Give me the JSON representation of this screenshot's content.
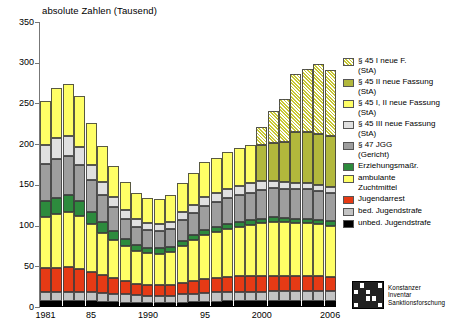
{
  "chart_data": {
    "type": "bar",
    "stacked": true,
    "title": "absolute Zahlen (Tausend)",
    "xlabel": "",
    "ylabel": "absolute Zahlen (Tausend)",
    "ylim": [
      0,
      350
    ],
    "ytick_labels": [
      "0",
      "50",
      "100",
      "150",
      "200",
      "250",
      "300",
      "350"
    ],
    "ytick_values": [
      0,
      50,
      100,
      150,
      200,
      250,
      300,
      350
    ],
    "grid": false,
    "legend_position": "right",
    "categories": [
      1981,
      1982,
      1983,
      1984,
      1985,
      1986,
      1987,
      1988,
      1989,
      1990,
      1991,
      1992,
      1993,
      1994,
      1995,
      1996,
      1997,
      1998,
      1999,
      2000,
      2001,
      2002,
      2003,
      2004,
      2005,
      2006
    ],
    "xtick_labels": [
      "1981",
      "85",
      "1990",
      "95",
      "2000",
      "2006"
    ],
    "xtick_categories": [
      1981,
      1985,
      1990,
      1995,
      2000,
      2006
    ],
    "series": [
      {
        "name": "unbed. Jugendstrafe",
        "color": "#000000",
        "hatch": false,
        "values": [
          7.0,
          7.0,
          7.0,
          7.0,
          7.0,
          6.5,
          6.0,
          5.5,
          5.0,
          5.0,
          5.0,
          5.0,
          5.5,
          6.0,
          6.5,
          6.5,
          7.0,
          7.0,
          7.0,
          7.0,
          7.0,
          7.0,
          7.0,
          7.0,
          7.0,
          7.0
        ]
      },
      {
        "name": "bed. Jugendstrafe",
        "color": "#c3c3c3",
        "hatch": false,
        "values": [
          12.0,
          12.0,
          12.0,
          12.0,
          11.5,
          11.0,
          10.5,
          10.0,
          9.5,
          9.0,
          9.0,
          9.0,
          10.0,
          10.5,
          11.0,
          11.5,
          12.0,
          12.0,
          12.0,
          12.0,
          12.5,
          12.5,
          12.5,
          12.5,
          12.5,
          12.5
        ]
      },
      {
        "name": "Jugendarrest",
        "color": "#e63a15",
        "hatch": false,
        "values": [
          29.0,
          29.0,
          30.0,
          28.0,
          25.0,
          22.0,
          19.0,
          16.0,
          14.0,
          13.0,
          12.5,
          12.5,
          14.0,
          15.5,
          17.0,
          17.5,
          18.0,
          18.5,
          19.0,
          19.0,
          19.0,
          18.5,
          18.5,
          18.5,
          18.0,
          17.5
        ]
      },
      {
        "name": "ambulante\nZuchtmittel",
        "color": "#ffff66",
        "hatch": false,
        "values": [
          63.0,
          66.0,
          68.0,
          65.0,
          58.0,
          52.0,
          47.0,
          43.0,
          40.0,
          39.0,
          39.0,
          41.0,
          46.0,
          50.0,
          54.0,
          57.0,
          59.0,
          61.0,
          63.0,
          65.0,
          66.0,
          66.0,
          65.0,
          65.0,
          64.0,
          63.0
        ]
      },
      {
        "name": "Erziehungsmaßr.",
        "color": "#2d8b3d",
        "hatch": false,
        "values": [
          19.0,
          20.0,
          20.0,
          18.0,
          15.0,
          13.0,
          11.0,
          9.0,
          8.0,
          7.0,
          6.5,
          6.0,
          6.0,
          6.0,
          6.0,
          5.5,
          5.5,
          5.5,
          5.5,
          5.5,
          5.5,
          5.5,
          5.5,
          5.5,
          5.5,
          5.5
        ]
      },
      {
        "name": "§ 47 JGG\n(Gericht)",
        "color": "#9e9e9e",
        "hatch": false,
        "values": [
          46.0,
          48.0,
          49.0,
          45.0,
          39.0,
          33.0,
          29.0,
          25.0,
          22.0,
          21.0,
          21.0,
          22.0,
          25.0,
          27.0,
          30.0,
          31.0,
          32.0,
          33.0,
          34.0,
          35.0,
          36.0,
          36.0,
          36.0,
          36.0,
          35.0,
          34.0
        ]
      },
      {
        "name": "§ 45 III neue Fassung\n(StA)",
        "color": "#e0e0e0",
        "hatch": false,
        "values": [
          23.0,
          25.0,
          24.0,
          22.0,
          19.0,
          16.0,
          13.0,
          11.0,
          10.0,
          9.0,
          9.0,
          9.5,
          10.0,
          10.5,
          11.0,
          11.5,
          12.0,
          12.0,
          12.0,
          11.0,
          9.0,
          8.0,
          8.0,
          8.0,
          8.0,
          8.0
        ]
      },
      {
        "name": "§ 45 I, II neue Fassung\n(StA)",
        "color": "#ffff66",
        "hatch": false,
        "values": [
          54.0,
          62.0,
          64.0,
          62.0,
          52.0,
          44.0,
          38.0,
          34.0,
          32.0,
          31.0,
          31.0,
          32.0,
          36.0,
          39.0,
          42.0,
          43.0,
          45.0,
          46.0,
          47.0,
          0,
          0,
          0,
          0,
          0,
          0,
          0
        ]
      },
      {
        "name": "§ 45 II neue Fassung\n(StA)",
        "color": "#b2b83c",
        "hatch": false,
        "values": [
          0,
          0,
          0,
          0,
          0,
          0,
          0,
          0,
          0,
          0,
          0,
          0,
          0,
          0,
          0,
          0,
          0,
          0,
          0,
          44.0,
          47.0,
          49.0,
          62.0,
          62.0,
          63.0,
          63.0
        ]
      },
      {
        "name": "§ 45 I neue F.\n(StA)",
        "color": "#c8c832",
        "hatch": true,
        "values": [
          0,
          0,
          0,
          0,
          0,
          0,
          0,
          0,
          0,
          0,
          0,
          0,
          0,
          0,
          0,
          0,
          0,
          0,
          0,
          22.0,
          39.0,
          53.0,
          72.0,
          78.0,
          86.0,
          80.0
        ]
      }
    ],
    "series_order_bottom_to_top": [
      "unbed. Jugendstrafe",
      "bed. Jugendstrafe",
      "Jugendarrest",
      "ambulante Zuchtmittel",
      "Erziehungsmaßr.",
      "§ 47 JGG (Gericht)",
      "§ 45 III neue Fassung (StA)",
      "§ 45 I, II neue Fassung (StA)",
      "§ 45 II neue Fassung (StA)",
      "§ 45 I neue F. (StA)"
    ],
    "totals": [
      253.0,
      269.0,
      274.0,
      259.0,
      226.5,
      197.5,
      173.5,
      153.5,
      140.5,
      134.0,
      133.0,
      137.0,
      152.5,
      164.5,
      177.5,
      184.0,
      190.5,
      195.0,
      199.5,
      220.5,
      241.0,
      256.0,
      286.5,
      292.5,
      299.0,
      290.5
    ]
  },
  "legend": {
    "items": [
      {
        "label": "§ 45 I neue F.\n(StA)",
        "color": "#c8c832",
        "hatch": true
      },
      {
        "label": "§ 45 II neue Fassung\n(StA)",
        "color": "#b2b83c",
        "hatch": false
      },
      {
        "label": "§ 45 I, II neue Fassung\n(StA)",
        "color": "#ffff66",
        "hatch": false
      },
      {
        "label": "§ 45 III neue Fassung\n(StA)",
        "color": "#e0e0e0",
        "hatch": false
      },
      {
        "label": "§ 47 JGG\n(Gericht)",
        "color": "#9e9e9e",
        "hatch": false
      },
      {
        "label": "Erziehungsmaßr.",
        "color": "#2d8b3d",
        "hatch": false
      },
      {
        "label": "ambulante\nZuchtmittel",
        "color": "#ffff66",
        "hatch": false
      },
      {
        "label": "Jugendarrest",
        "color": "#e63a15",
        "hatch": false
      },
      {
        "label": "bed. Jugendstrafe",
        "color": "#c3c3c3",
        "hatch": false
      },
      {
        "label": "unbed. Jugendstrafe",
        "color": "#000000",
        "hatch": false
      }
    ]
  },
  "logo": {
    "line1": "Konstanzer",
    "line2": "Inventar",
    "line3": "Sanktionsforschung"
  }
}
